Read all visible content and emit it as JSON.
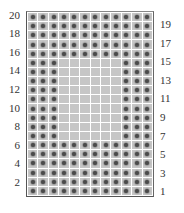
{
  "diagram": {
    "type": "bead-grid",
    "columns": 12,
    "rows": 20,
    "colors": {
      "cell": "#c6c6c6",
      "grid_line": "#ffffff",
      "dot": "#4a4a4a",
      "border": "#555555",
      "label": "#333333"
    },
    "left_labels": [
      "20",
      "18",
      "16",
      "14",
      "12",
      "10",
      "8",
      "6",
      "4",
      "2"
    ],
    "right_labels": [
      "19",
      "17",
      "15",
      "13",
      "11",
      "9",
      "7",
      "5",
      "3",
      "1"
    ],
    "pattern_rows_top_to_bottom": [
      "111111111111",
      "111111111111",
      "111111111111",
      "111111111111",
      "111111111111",
      "111000000111",
      "111000000111",
      "111000000111",
      "111000000111",
      "111000000111",
      "111000000111",
      "111000000111",
      "111000000111",
      "111000000111",
      "111111111111",
      "111111111111",
      "111111111111",
      "111111111111",
      "111111111111",
      "111111111111"
    ]
  }
}
